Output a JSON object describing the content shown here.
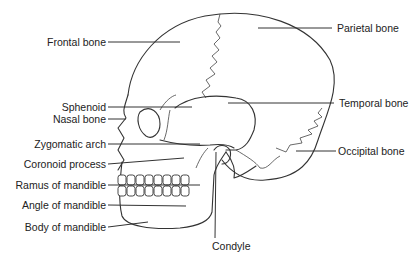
{
  "diagram": {
    "labels_left": [
      {
        "id": "frontal",
        "text": "Frontal bone"
      },
      {
        "id": "sphenoid",
        "text": "Sphenoid"
      },
      {
        "id": "nasal",
        "text": "Nasal bone"
      },
      {
        "id": "zygomatic",
        "text": "Zygomatic arch"
      },
      {
        "id": "coronoid",
        "text": "Coronoid process"
      },
      {
        "id": "ramus",
        "text": "Ramus of mandible"
      },
      {
        "id": "angle",
        "text": "Angle of mandible"
      },
      {
        "id": "body",
        "text": "Body of mandible"
      }
    ],
    "labels_right": [
      {
        "id": "parietal",
        "text": "Parietal bone"
      },
      {
        "id": "temporal",
        "text": "Temporal bone"
      },
      {
        "id": "occipital",
        "text": "Occipital bone"
      }
    ],
    "labels_bottom": [
      {
        "id": "condyle",
        "text": "Condyle"
      }
    ],
    "colors": {
      "ink": "#333333",
      "background": "#ffffff"
    }
  }
}
